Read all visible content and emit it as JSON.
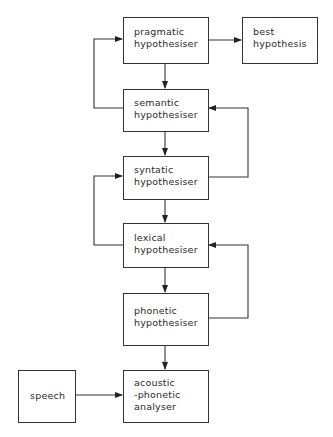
{
  "diagram": {
    "type": "flowchart",
    "nodes": [
      {
        "id": "pragmatic",
        "lines": [
          "pragmatic",
          "hypothesiser"
        ]
      },
      {
        "id": "best",
        "lines": [
          "best",
          "hypothesis"
        ]
      },
      {
        "id": "semantic",
        "lines": [
          "semantic",
          "hypothesiser"
        ]
      },
      {
        "id": "syntatic",
        "lines": [
          "syntatic",
          "hypothesiser"
        ]
      },
      {
        "id": "lexical",
        "lines": [
          "lexical",
          "hypothesiser"
        ]
      },
      {
        "id": "phonetic",
        "lines": [
          "phonetic",
          "hypothesiser"
        ]
      },
      {
        "id": "speech",
        "lines": [
          "speech"
        ]
      },
      {
        "id": "acoustic",
        "lines": [
          "acoustic",
          "-phonetic",
          "analyser"
        ]
      }
    ],
    "edges": [
      {
        "from": "pragmatic",
        "to": "best"
      },
      {
        "from": "pragmatic",
        "to": "semantic"
      },
      {
        "from": "semantic",
        "to": "pragmatic",
        "route": "left-loop"
      },
      {
        "from": "semantic",
        "to": "syntatic"
      },
      {
        "from": "syntatic",
        "to": "semantic",
        "route": "right-loop"
      },
      {
        "from": "syntatic",
        "to": "lexical"
      },
      {
        "from": "lexical",
        "to": "syntatic",
        "route": "left-loop"
      },
      {
        "from": "lexical",
        "to": "phonetic"
      },
      {
        "from": "phonetic",
        "to": "lexical",
        "route": "right-loop"
      },
      {
        "from": "phonetic",
        "to": "acoustic"
      },
      {
        "from": "speech",
        "to": "acoustic"
      }
    ],
    "colors": {
      "line": "#333333",
      "text": "#2a2a2a",
      "background": "#ffffff"
    }
  }
}
